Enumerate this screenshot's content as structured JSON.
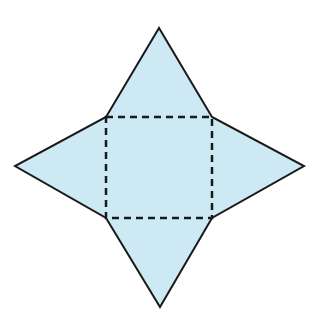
{
  "diagram": {
    "colors": {
      "fill": "#cdeaf4",
      "outline": "#1a1a1a",
      "fold_line": "#1a1a1a",
      "background": "#ffffff"
    },
    "base_square": {
      "corners": [
        [
          106,
          117
        ],
        [
          212,
          117
        ],
        [
          212,
          218
        ],
        [
          106,
          218
        ]
      ],
      "line_style": "dashed"
    },
    "triangles": [
      {
        "name": "top",
        "apex": [
          159,
          28
        ]
      },
      {
        "name": "right",
        "apex": [
          304,
          166
        ]
      },
      {
        "name": "bottom",
        "apex": [
          160,
          307
        ]
      },
      {
        "name": "left",
        "apex": [
          15,
          166
        ]
      }
    ]
  }
}
